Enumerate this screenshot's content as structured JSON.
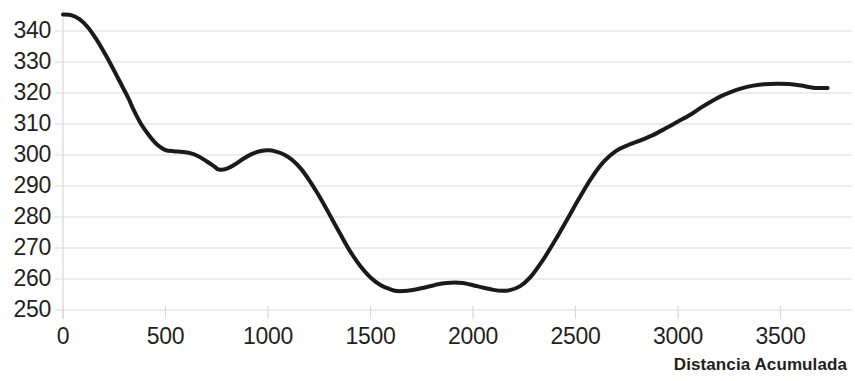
{
  "chart_data": {
    "type": "line",
    "title": "",
    "subtitle": "",
    "xlabel": "Distancia Acumulada",
    "ylabel": "",
    "xlim": [
      0,
      3790
    ],
    "ylim": [
      249,
      347
    ],
    "grid": true,
    "legend": false,
    "legend_position": "none",
    "x_ticks": [
      0,
      500,
      1000,
      1500,
      2000,
      2500,
      3000,
      3500
    ],
    "x_tick_labels": [
      "0",
      "500",
      "1000",
      "1500",
      "2000",
      "2500",
      "3000",
      "3500"
    ],
    "y_ticks": [
      250,
      260,
      270,
      280,
      290,
      300,
      310,
      320,
      330,
      340
    ],
    "y_tick_labels": [
      "250",
      "260",
      "270",
      "280",
      "290",
      "300",
      "310",
      "320",
      "330",
      "340"
    ],
    "line_color": "#1a1a1a",
    "line_width": 4,
    "grid_color": "#d9d9d9",
    "background_color": "#ffffff",
    "series": [
      {
        "name": "Perfil",
        "x": [
          0,
          40,
          80,
          120,
          160,
          200,
          240,
          280,
          320,
          340,
          380,
          420,
          460,
          500,
          540,
          580,
          620,
          660,
          700,
          740,
          760,
          800,
          840,
          880,
          920,
          960,
          1000,
          1040,
          1080,
          1120,
          1160,
          1200,
          1240,
          1280,
          1320,
          1360,
          1400,
          1450,
          1500,
          1550,
          1600,
          1630,
          1680,
          1720,
          1760,
          1800,
          1830,
          1870,
          1910,
          1950,
          2000,
          2050,
          2100,
          2140,
          2180,
          2230,
          2280,
          2340,
          2400,
          2460,
          2520,
          2580,
          2640,
          2700,
          2760,
          2820,
          2880,
          2940,
          3000,
          3060,
          3110,
          3160,
          3210,
          3260,
          3310,
          3360,
          3420,
          3480,
          3540,
          3600,
          3660,
          3730
        ],
        "y": [
          345.3,
          345.1,
          343.8,
          341.3,
          337.6,
          333.2,
          328.4,
          323.3,
          318.2,
          315.2,
          310.1,
          306.3,
          303.3,
          301.6,
          301.2,
          301.0,
          300.6,
          299.6,
          298.0,
          296.2,
          295.3,
          295.6,
          297.0,
          298.8,
          300.3,
          301.2,
          301.5,
          301.1,
          300.1,
          298.3,
          295.6,
          292.0,
          287.8,
          283.2,
          278.4,
          273.6,
          269.0,
          264.2,
          260.5,
          258.0,
          256.6,
          256.1,
          256.2,
          256.6,
          257.2,
          257.8,
          258.3,
          258.7,
          258.9,
          258.7,
          258.0,
          257.2,
          256.5,
          256.2,
          256.4,
          257.7,
          260.6,
          266.0,
          272.4,
          279.3,
          286.3,
          292.8,
          298.0,
          301.4,
          303.3,
          304.8,
          306.5,
          308.6,
          310.8,
          313.0,
          315.2,
          317.2,
          319.0,
          320.4,
          321.5,
          322.3,
          322.8,
          323.0,
          322.9,
          322.4,
          321.7,
          321.6
        ]
      }
    ],
    "annotations": []
  },
  "axes": {
    "x_title": "Distancia Acumulada"
  }
}
